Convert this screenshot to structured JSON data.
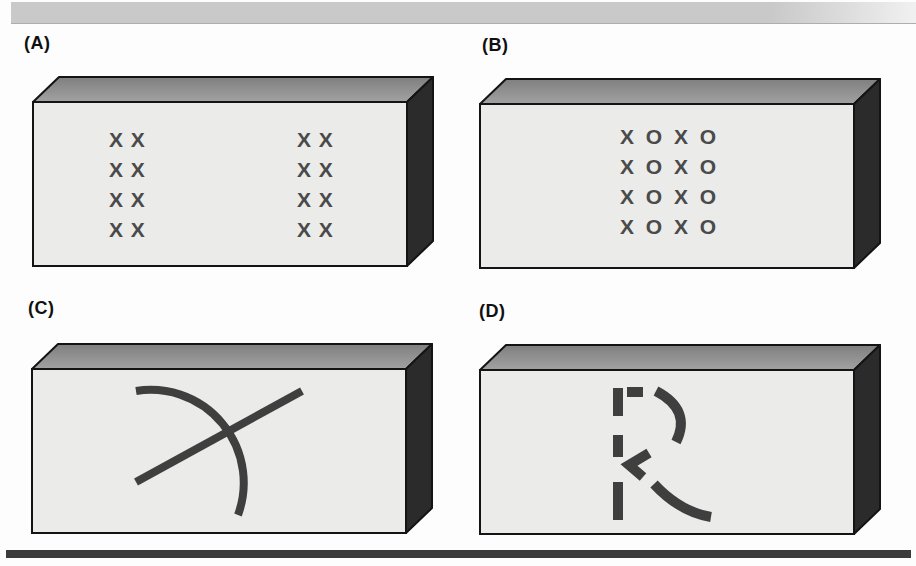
{
  "box_colors": {
    "front": "#ebebe9",
    "top_back": "#7f7f7f",
    "top_front": "#a2a2a2",
    "side": "#2b2b2b",
    "outline": "#141414",
    "mark": "#4a4a4a",
    "stroke": "#3f3f3f"
  },
  "decorations": {
    "top_bar_color": "#c9c9c9",
    "bottom_bar_color": "#3b3b3b"
  },
  "panels": [
    {
      "label": "(A)",
      "shape": "x-mark-grid-two-clusters",
      "clusters": {
        "left_rows": [
          "X X",
          "X X",
          "X X",
          "X X"
        ],
        "right_rows": [
          "X X",
          "X X",
          "X X",
          "X X"
        ]
      }
    },
    {
      "label": "(B)",
      "shape": "xoxo-grid",
      "rows": [
        "X O X O",
        "X O X O",
        "X O X O",
        "X O X O"
      ]
    },
    {
      "label": "(C)",
      "shape": "arc-crossed-by-straight-line"
    },
    {
      "label": "(D)",
      "shape": "dashed-letter-R"
    }
  ]
}
